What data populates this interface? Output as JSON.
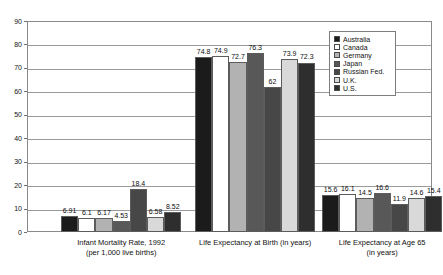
{
  "chart_data": {
    "type": "bar",
    "title": "",
    "subtitle": "",
    "xlabel": "",
    "ylabel": "",
    "ylim": [
      0,
      90
    ],
    "ytick_step": 10,
    "yticks": [
      "0",
      "10",
      "20",
      "30",
      "40",
      "50",
      "60",
      "70",
      "80",
      "90"
    ],
    "grid": true,
    "legend_position": "top-right",
    "categories": [
      "Infant Mortality Rate, 1992\n(per 1,000 live births)",
      "Life Expectancy at Birth (in years)",
      "Life Expectancy at Age 65\n(in years)"
    ],
    "category_labels": [
      {
        "line1": "Infant Mortality Rate, 1992",
        "line2": "(per 1,000 live births)"
      },
      {
        "line1": "Life Expectancy at Birth (in years)",
        "line2": ""
      },
      {
        "line1": "Life Expectancy at Age 65",
        "line2": "(in years)"
      }
    ],
    "series": [
      {
        "name": "Australia",
        "color": "#1b1b1b",
        "values": [
          6.91,
          74.8,
          15.6
        ]
      },
      {
        "name": "Canada",
        "color": "#ffffff",
        "values": [
          6.1,
          74.9,
          16.1
        ]
      },
      {
        "name": "Germany",
        "color": "#b2b2b2",
        "values": [
          6.17,
          72.7,
          14.5
        ]
      },
      {
        "name": "Japan",
        "color": "#585858",
        "values": [
          4.53,
          76.3,
          16.6
        ]
      },
      {
        "name": "Russian Fed.",
        "color": "#474747",
        "values": [
          18.4,
          62.0,
          11.9
        ]
      },
      {
        "name": "U.K.",
        "color": "#d9d9d9",
        "values": [
          6.58,
          73.9,
          14.6
        ]
      },
      {
        "name": "U.S.",
        "color": "#2e2e2e",
        "values": [
          8.52,
          72.3,
          15.4
        ]
      }
    ],
    "value_labels": [
      [
        "6.91",
        "6.1",
        "6.17",
        "4.53",
        "18.4",
        "6.58",
        "8.52"
      ],
      [
        "74.8",
        "74.9",
        "72.7",
        "76.3",
        "62",
        "73.9",
        "72.3"
      ],
      [
        "15.6",
        "16.1",
        "14.5",
        "16.6",
        "11.9",
        "14.6",
        "15.4"
      ]
    ]
  },
  "legend": {
    "items": [
      {
        "label": "Australia"
      },
      {
        "label": "Canada"
      },
      {
        "label": "Germany"
      },
      {
        "label": "Japan"
      },
      {
        "label": "Russian Fed."
      },
      {
        "label": "U.K."
      },
      {
        "label": "U.S."
      }
    ]
  }
}
